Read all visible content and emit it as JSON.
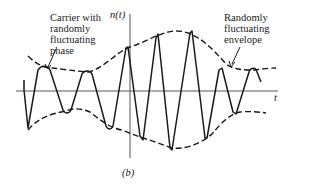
{
  "figure": {
    "caption": "(b)",
    "y_axis_label": "n(t)",
    "x_axis_label": "t",
    "annotations": [
      {
        "id": "phase",
        "lines": [
          "Carrier with",
          "randomly",
          "fluctuating",
          "phase"
        ]
      },
      {
        "id": "envelope",
        "lines": [
          "Randomly",
          "fluctuating",
          "envelope"
        ]
      }
    ],
    "colors": {
      "ink": "#1a1a1a",
      "axis": "#555555",
      "background": "#ffffff"
    }
  }
}
